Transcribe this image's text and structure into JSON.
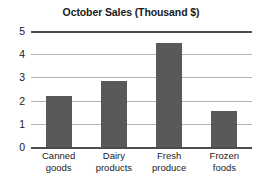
{
  "chart_data": {
    "type": "bar",
    "title": "October Sales (Thousand $)",
    "xlabel": "",
    "ylabel": "",
    "categories": [
      "Canned goods",
      "Dairy products",
      "Fresh produce",
      "Frozen foods"
    ],
    "category_lines": [
      [
        "Canned",
        "goods"
      ],
      [
        "Dairy",
        "products"
      ],
      [
        "Fresh",
        "produce"
      ],
      [
        "Frozen",
        "foods"
      ]
    ],
    "values": [
      2.2,
      2.85,
      4.5,
      1.55
    ],
    "ylim": [
      0,
      5
    ],
    "yticks": [
      0,
      1,
      2,
      3,
      4,
      5
    ],
    "ytick_labels": [
      "0",
      "1",
      "2",
      "3",
      "4",
      "5"
    ],
    "grid": true,
    "grid_axis": "y",
    "legend": false,
    "legend_position": "none",
    "colors": {
      "bar": "#595959",
      "gridline": "#b3b3b3",
      "axis_line": "#4d4d4d",
      "text": "#1a1a1a",
      "background": "#ffffff"
    }
  }
}
